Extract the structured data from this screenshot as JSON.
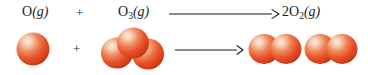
{
  "diagram": {
    "equation_plain": "O(g) + O3(g) -> 2O2(g)",
    "colors": {
      "atom_core": "#e8512a",
      "atom_highlight": "#f7dcc8",
      "atom_shadow": "#b8340f",
      "atom_rim": "#c63a14",
      "text": "#1c1c1c",
      "arrow": "#1a1a1a",
      "background": "#ffffff"
    },
    "equation": {
      "reactant_atom": {
        "element": "O",
        "subscript": "",
        "coefficient": "",
        "state": "(g)"
      },
      "plus_sign": "+",
      "reactant_molecule": {
        "element": "O",
        "subscript": "3",
        "coefficient": "",
        "state": "(g)"
      },
      "arrow_glyph": "yields-arrow",
      "product": {
        "element": "O",
        "subscript": "2",
        "coefficient": "2",
        "state": "(g)"
      }
    },
    "models": [
      {
        "name": "oxygen-atom-model",
        "formula": "O",
        "atom_count": 1,
        "geometry": "single-sphere"
      },
      {
        "name": "ozone-model",
        "formula": "O3",
        "atom_count": 3,
        "geometry": "bent"
      },
      {
        "name": "dioxygen-model-1",
        "formula": "O2",
        "atom_count": 2,
        "geometry": "linear-diatomic"
      },
      {
        "name": "dioxygen-model-2",
        "formula": "O2",
        "atom_count": 2,
        "geometry": "linear-diatomic"
      }
    ]
  }
}
